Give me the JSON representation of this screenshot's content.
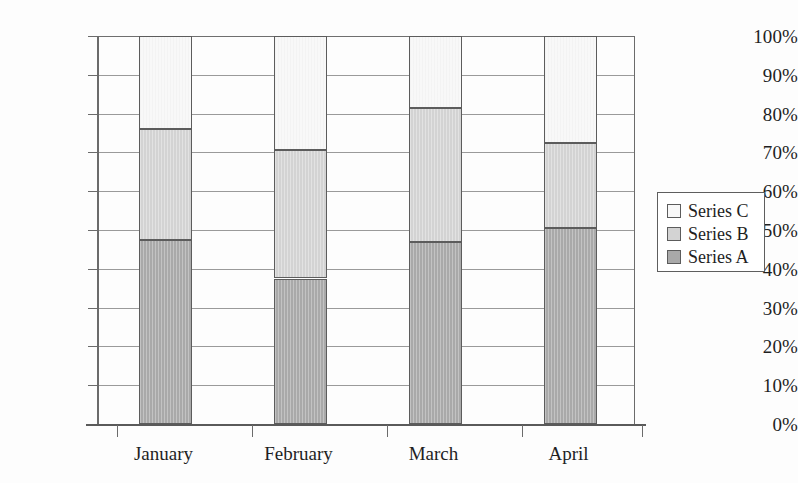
{
  "chart_data": {
    "type": "bar",
    "subtype": "100% stacked column",
    "title": "",
    "subtitle": "",
    "xlabel": "",
    "ylabel": "",
    "categories": [
      "January",
      "February",
      "March",
      "April"
    ],
    "series": [
      {
        "name": "Series A",
        "color": "#a9a9a9",
        "values": [
          47.5,
          37.5,
          47.0,
          50.5
        ]
      },
      {
        "name": "Series B",
        "color": "#d3d3d3",
        "values": [
          28.5,
          33.0,
          34.5,
          22.0
        ]
      },
      {
        "name": "Series C",
        "color": "#f8f8f8",
        "values": [
          24.0,
          29.5,
          18.5,
          27.5
        ]
      }
    ],
    "stack_tops": {
      "Series A": [
        47.5,
        37.5,
        47.0,
        50.5
      ],
      "Series B": [
        76.0,
        70.5,
        81.5,
        72.5
      ],
      "Series C": [
        100.0,
        100.0,
        100.0,
        100.0
      ]
    },
    "ylim": [
      0,
      100
    ],
    "ytick_labels": [
      "0%",
      "10%",
      "20%",
      "30%",
      "40%",
      "50%",
      "60%",
      "70%",
      "80%",
      "90%",
      "100%"
    ],
    "ytick_values": [
      0,
      10,
      20,
      30,
      40,
      50,
      60,
      70,
      80,
      90,
      100
    ],
    "grid": true,
    "grid_axis": "y",
    "legend_position": "right",
    "legend_order": [
      "Series C",
      "Series B",
      "Series A"
    ]
  },
  "legend": {
    "items": [
      {
        "label": "Series C",
        "color": "#f8f8f8"
      },
      {
        "label": "Series B",
        "color": "#d3d3d3"
      },
      {
        "label": "Series A",
        "color": "#a9a9a9"
      }
    ]
  }
}
